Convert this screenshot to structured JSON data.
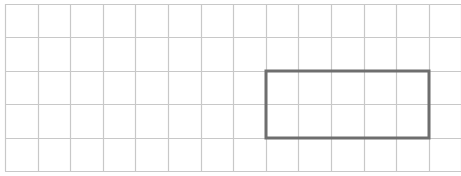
{
  "diagram": {
    "type": "grid",
    "columns": 14,
    "rows": 5,
    "origin": {
      "x": 5,
      "y": 4
    },
    "cell_width": 32.6,
    "cell_height": 33.4,
    "grid_color": "#c8c8c8",
    "highlight_rect": {
      "col_start": 8,
      "row_start": 2,
      "col_span": 5,
      "row_span": 2,
      "stroke_color": "#6e6e6e",
      "stroke_width": 3
    }
  }
}
